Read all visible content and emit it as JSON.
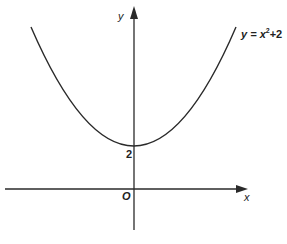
{
  "diagram": {
    "axes": {
      "x_label": "x",
      "y_label": "y",
      "origin_label": "O"
    },
    "curve": {
      "equation_label": "y = x² + 2",
      "equation_lhs": "y = x",
      "equation_exp": "2",
      "equation_rhs": "+2",
      "y_intercept_label": "2",
      "color": "#2a2a2a"
    }
  }
}
